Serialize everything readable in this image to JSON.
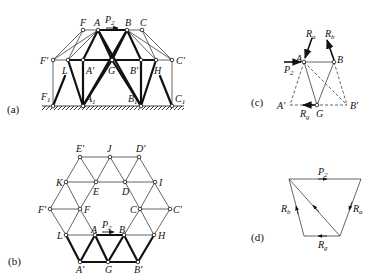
{
  "panels": {
    "a": {
      "tag": "(a)",
      "load": "P2",
      "nodes": [
        "F",
        "A",
        "B",
        "C",
        "F'",
        "L",
        "A'",
        "G",
        "B'",
        "H",
        "C'",
        "F1",
        "A1",
        "B1",
        "C1"
      ]
    },
    "b": {
      "tag": "(b)",
      "load": "P2",
      "nodes": [
        "E'",
        "J",
        "D'",
        "K",
        "E",
        "D",
        "I",
        "F'",
        "F",
        "C",
        "C'",
        "L",
        "A",
        "B",
        "H",
        "A'",
        "G",
        "B'"
      ]
    },
    "c": {
      "tag": "(c)",
      "forces": [
        "Ra",
        "Rb",
        "P2",
        "Rg"
      ],
      "nodes": [
        "A",
        "B",
        "A'",
        "G",
        "B'"
      ]
    },
    "d": {
      "tag": "(d)",
      "forces": [
        "P2",
        "Ra",
        "Rb",
        "Rg"
      ]
    }
  },
  "labels": {
    "a_tag": "(a)",
    "b_tag": "(b)",
    "c_tag": "(c)",
    "d_tag": "(d)",
    "P": "P",
    "sub2": "2",
    "R": "R",
    "sa": "a",
    "sb": "b",
    "sg": "g",
    "s1": "1",
    "F": "F",
    "A": "A",
    "B": "B",
    "C": "C",
    "Fp": "F'",
    "L": "L",
    "Ap": "A'",
    "G": "G",
    "Bp": "B'",
    "H": "H",
    "Cp": "C'",
    "E": "E",
    "Ep": "E'",
    "J": "J",
    "Dp": "D'",
    "K": "K",
    "D": "D",
    "I": "I"
  }
}
